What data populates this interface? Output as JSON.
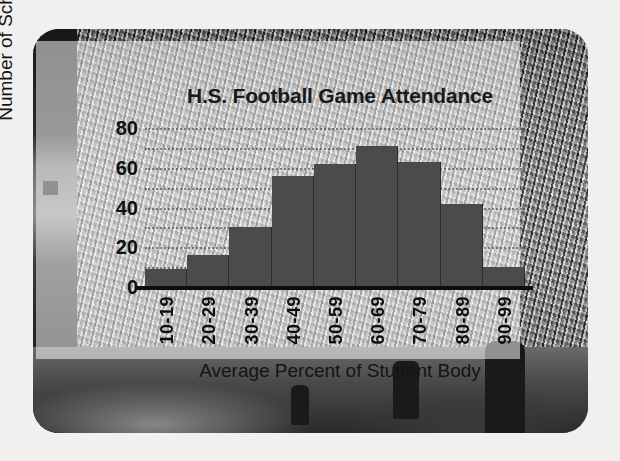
{
  "figure": {
    "background_photo": "stadium-crowd-grayscale",
    "card_corner_radius_px": 26
  },
  "chart_data": {
    "type": "bar",
    "title": "H.S. Football Game Attendance",
    "xlabel": "Average Percent of Student Body",
    "ylabel": "Number of Schools",
    "categories": [
      "10-19",
      "20-29",
      "30-39",
      "40-49",
      "50-59",
      "60-69",
      "70-79",
      "80-89",
      "90-99"
    ],
    "values": [
      9,
      16,
      30,
      56,
      62,
      71,
      63,
      42,
      10
    ],
    "ylim": [
      0,
      85
    ],
    "ytick_labels": [
      "0",
      "20",
      "40",
      "60",
      "80"
    ],
    "ytick_values": [
      0,
      20,
      40,
      60,
      80
    ],
    "gridline_values": [
      10,
      20,
      30,
      40,
      50,
      60,
      70,
      80
    ],
    "grid": true,
    "grid_style": "dotted",
    "legend": "none",
    "bar_color": "#4b4b4b",
    "axis_color": "#0d0d0d",
    "text_color": "#101010"
  }
}
